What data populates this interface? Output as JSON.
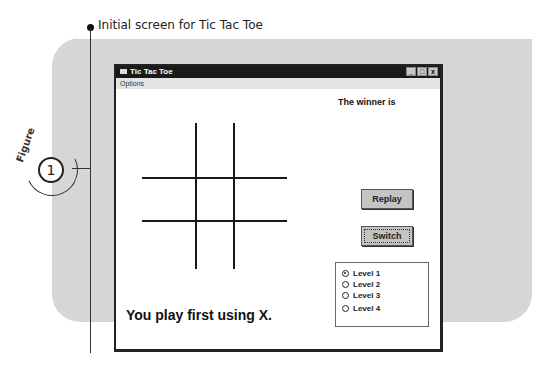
{
  "figure": {
    "caption": "Initial screen for Tic Tac Toe",
    "label": "Figure",
    "number": "1"
  },
  "window": {
    "title": "Tic Tac Toe",
    "controls": {
      "minimize": "_",
      "maximize": "□",
      "close": "x"
    },
    "menu": [
      {
        "label": "Options"
      }
    ],
    "winner_label": "The winner is",
    "buttons": {
      "replay": "Replay",
      "switch": "Switch"
    },
    "levels": [
      {
        "label": "Level 1",
        "checked": true
      },
      {
        "label": "Level 2",
        "checked": false
      },
      {
        "label": "Level 3",
        "checked": false
      },
      {
        "label": "Level 4",
        "checked": false
      }
    ],
    "status_text": "You play first using X.",
    "board": {
      "cells": [
        "",
        "",
        "",
        "",
        "",
        "",
        "",
        "",
        ""
      ]
    }
  },
  "colors": {
    "panel": "#d6d6d6",
    "titlebar": "#1a1a1a",
    "button": "#c4c4c4"
  }
}
